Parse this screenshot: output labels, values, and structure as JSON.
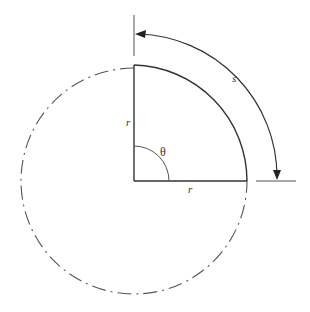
{
  "diagram": {
    "labels": {
      "radius_vertical": "r",
      "radius_horizontal": "r",
      "angle": "θ",
      "arc_length": "s"
    },
    "geometry": {
      "center": [
        134,
        181
      ],
      "radius": 113,
      "outer_arc_radius": 147,
      "angle_degrees": 90
    },
    "colors": {
      "stroke": "#333333",
      "background": "#ffffff"
    }
  }
}
